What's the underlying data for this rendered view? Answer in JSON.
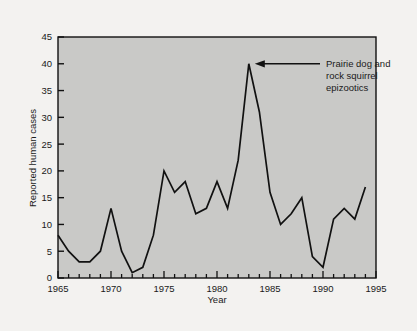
{
  "chart_data": {
    "type": "line",
    "title": "",
    "xlabel": "Year",
    "ylabel": "Reported human cases",
    "xlim": [
      1965,
      1995
    ],
    "ylim": [
      0,
      45
    ],
    "xticks": [
      1965,
      1970,
      1975,
      1980,
      1985,
      1990,
      1995
    ],
    "xtick_labels": [
      "1965",
      "1970",
      "1975",
      "1980",
      "1985",
      "1990",
      "1995"
    ],
    "x_minor_tick_step": 1,
    "yticks": [
      0,
      5,
      10,
      15,
      20,
      25,
      30,
      35,
      40,
      45
    ],
    "ytick_labels": [
      "0",
      "5",
      "10",
      "15",
      "20",
      "25",
      "30",
      "35",
      "40",
      "45"
    ],
    "grid": false,
    "legend": false,
    "x": [
      1965,
      1966,
      1967,
      1968,
      1969,
      1970,
      1971,
      1972,
      1973,
      1974,
      1975,
      1976,
      1977,
      1978,
      1979,
      1980,
      1981,
      1982,
      1983,
      1984,
      1985,
      1986,
      1987,
      1988,
      1989,
      1990,
      1991,
      1992,
      1993,
      1994
    ],
    "values": [
      8,
      5,
      3,
      3,
      5,
      13,
      5,
      1,
      2,
      8,
      20,
      16,
      18,
      12,
      13,
      18,
      13,
      22,
      40,
      31,
      16,
      10,
      12,
      15,
      4,
      2,
      11,
      13,
      11,
      17
    ],
    "series": [
      {
        "name": "Reported human cases",
        "values": [
          8,
          5,
          3,
          3,
          5,
          13,
          5,
          1,
          2,
          8,
          20,
          16,
          18,
          12,
          13,
          18,
          13,
          22,
          40,
          31,
          16,
          10,
          12,
          15,
          4,
          2,
          11,
          13,
          11,
          17
        ]
      }
    ],
    "annotations": [
      {
        "text_lines": [
          "Prairie dog and",
          "rock squirrel",
          "epizootics"
        ],
        "points_to_x": 1983,
        "points_to_y": 40,
        "arrow": true
      }
    ],
    "colors": {
      "plot_background": "#c9c9c7",
      "figure_background": "#f3f2f0",
      "line": "#111111",
      "axis": "#111111",
      "text": "#1a1a1a"
    }
  },
  "annotation": {
    "line1": "Prairie dog and",
    "line2": "rock squirrel",
    "line3": "epizootics"
  },
  "axes": {
    "x_title": "Year",
    "y_title": "Reported human cases"
  }
}
